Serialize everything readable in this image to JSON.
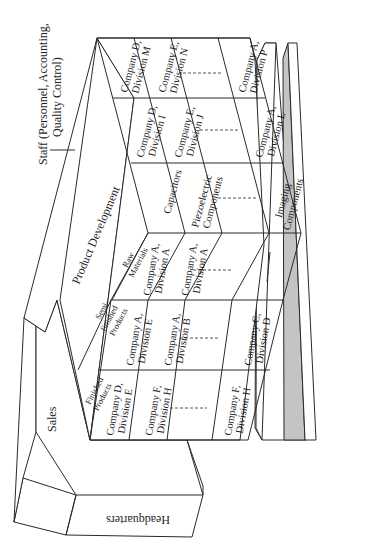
{
  "diagram": {
    "orientation": "rotated 90 degrees counter-clockwise",
    "headquarters": "Headquarters",
    "sales": "Sales",
    "product_development": "Product Development",
    "staff": "Staff (Personnel, Accounting, Quality Control)",
    "staff_line1": "Staff (Personnel, Accounting,",
    "staff_line2": "Quality Control)",
    "row_headers": {
      "finished": [
        "Finished",
        "Products"
      ],
      "semi": [
        "Semi-",
        "finished",
        "Products"
      ],
      "raw": [
        "Raw",
        "Materials"
      ]
    },
    "rows": [
      {
        "name": "Finished Products",
        "cells": [
          [
            "Company D,",
            "Division E"
          ],
          [
            "Company F,",
            "Division H"
          ],
          [],
          [
            "Company F,",
            "Division H"
          ]
        ]
      },
      {
        "name": "Semi-finished Products",
        "cells": [
          [
            "Company A,",
            "Division E"
          ],
          [
            "Company A,",
            "Division B"
          ],
          [],
          [
            "Company C,",
            "Division D"
          ]
        ]
      },
      {
        "name": "Raw Materials",
        "cells": [
          [
            "Company A,",
            "Division A"
          ],
          [
            "Company A,",
            "Division A"
          ],
          [],
          [
            "—"
          ]
        ]
      },
      {
        "name": "Components",
        "cells": [
          [
            "Capacitors"
          ],
          [
            "Piezoelectric",
            "Components"
          ],
          [],
          [
            "Imaging",
            "Components"
          ]
        ]
      },
      {
        "name": "Upper row 1",
        "cells": [
          [
            "Company D,",
            "Division I"
          ],
          [
            "Company E,",
            "Division J"
          ],
          [],
          [
            "Company A,",
            "Division L"
          ]
        ]
      },
      {
        "name": "Upper row 2",
        "cells": [
          [
            "Company D,",
            "Division M"
          ],
          [
            "Company E,",
            "Division N"
          ],
          [],
          [
            "Company A,",
            "Division P"
          ]
        ]
      }
    ]
  }
}
